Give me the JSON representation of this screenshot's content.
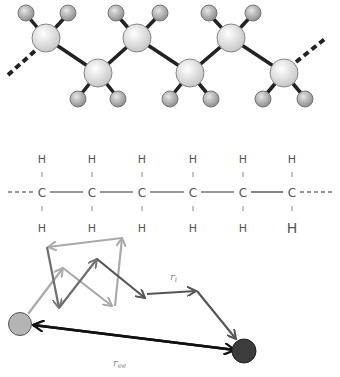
{
  "ball_stick": {
    "carbons": [
      {
        "x": 46,
        "y": 38,
        "up": true
      },
      {
        "x": 98,
        "y": 73,
        "up": false
      },
      {
        "x": 137,
        "y": 38,
        "up": true
      },
      {
        "x": 190,
        "y": 73,
        "up": false
      },
      {
        "x": 231,
        "y": 38,
        "up": true
      },
      {
        "x": 284,
        "y": 73,
        "up": false
      }
    ],
    "colors": {
      "carbon": "#e8e8e8",
      "hydrogen": "#b8b8b8",
      "bond": "#222222"
    }
  },
  "structural_formula": {
    "atoms": [
      "C",
      "C",
      "C",
      "C",
      "C",
      "C"
    ],
    "top_hydrogens": [
      "H",
      "H",
      "H",
      "H",
      "H",
      "H"
    ],
    "bottom_hydrogens": [
      "H",
      "H",
      "H",
      "H",
      "H",
      "H"
    ],
    "xs": [
      42,
      92,
      142,
      193,
      243,
      292
    ]
  },
  "random_walk": {
    "segment_label": "r",
    "segment_label_sub": "i",
    "end_to_end_label": "r",
    "end_to_end_label_sub": "ee",
    "start_color": "#b0b0b0",
    "end_color": "#3a3a3a"
  }
}
